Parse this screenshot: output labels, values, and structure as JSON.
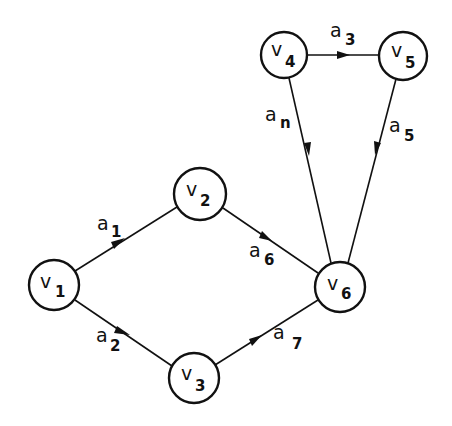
{
  "diagram": {
    "type": "directed-graph",
    "nodes": [
      {
        "id": "v1",
        "label": "v",
        "sub": "1",
        "cx": 54,
        "cy": 285,
        "r": 25
      },
      {
        "id": "v2",
        "label": "v",
        "sub": "2",
        "cx": 200,
        "cy": 194,
        "r": 26
      },
      {
        "id": "v3",
        "label": "v",
        "sub": "3",
        "cx": 194,
        "cy": 378,
        "r": 25
      },
      {
        "id": "v4",
        "label": "v",
        "sub": "4",
        "cx": 284,
        "cy": 55,
        "r": 23
      },
      {
        "id": "v5",
        "label": "v",
        "sub": "5",
        "cx": 403,
        "cy": 56,
        "r": 24
      },
      {
        "id": "v6",
        "label": "v",
        "sub": "6",
        "cx": 340,
        "cy": 287,
        "r": 25
      }
    ],
    "edges": [
      {
        "id": "a1",
        "from": "v1",
        "to": "v2",
        "label": "a",
        "sub": "1"
      },
      {
        "id": "a2",
        "from": "v1",
        "to": "v3",
        "label": "a",
        "sub": "2"
      },
      {
        "id": "a3",
        "from": "v4",
        "to": "v5",
        "label": "a",
        "sub": "3"
      },
      {
        "id": "an",
        "from": "v4",
        "to": "v6",
        "label": "a",
        "sub": "n"
      },
      {
        "id": "a5",
        "from": "v5",
        "to": "v6",
        "label": "a",
        "sub": "5"
      },
      {
        "id": "a6",
        "from": "v2",
        "to": "v6",
        "label": "a",
        "sub": "6"
      },
      {
        "id": "a7",
        "from": "v3",
        "to": "v6",
        "label": "a",
        "sub": "7"
      }
    ]
  }
}
